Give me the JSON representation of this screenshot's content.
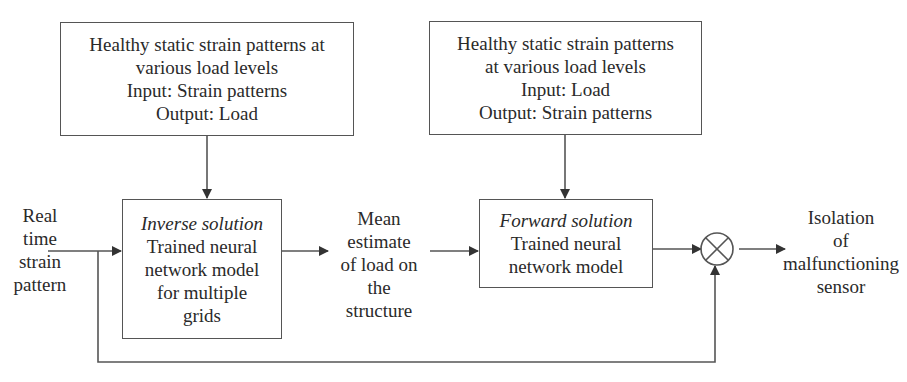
{
  "diagram": {
    "top_left_box": {
      "lines": [
        "Healthy static strain patterns at",
        "various load levels",
        "Input: Strain patterns",
        "Output: Load"
      ]
    },
    "top_right_box": {
      "lines": [
        "Healthy static strain patterns",
        "at various load levels",
        "Input: Load",
        "Output: Strain patterns"
      ]
    },
    "inverse_box": {
      "title": "Inverse solution",
      "lines": [
        "Trained neural",
        "network model",
        "for multiple",
        "grids"
      ]
    },
    "forward_box": {
      "title": "Forward solution",
      "lines": [
        "Trained neural",
        "network model"
      ]
    },
    "input_label": {
      "lines": [
        "Real",
        "time",
        "strain",
        "pattern"
      ]
    },
    "mean_label": {
      "lines": [
        "Mean",
        "estimate",
        "of load on",
        "the",
        "structure"
      ]
    },
    "output_label": {
      "lines": [
        "Isolation",
        "of",
        "malfunctioning",
        "sensor"
      ]
    },
    "comparator": {
      "symbol": "⊗"
    },
    "colors": {
      "stroke": "#555555",
      "text": "#2a2a2a",
      "background": "#ffffff"
    }
  }
}
